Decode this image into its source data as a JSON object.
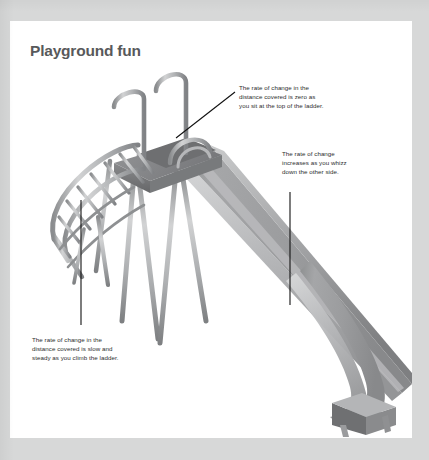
{
  "page": {
    "title": "Playground fun",
    "background_color": "#d7d8d8",
    "sheet_color": "#ffffff",
    "title_color": "#58595b"
  },
  "illustration": {
    "name": "playground-slide-illustration",
    "subject": "playground slide with ladder and platform",
    "palette": {
      "metal_light": "#c8c9ca",
      "metal_mid": "#a7a9ac",
      "metal_dark": "#808285",
      "metal_shadow": "#6d6e71",
      "slide_face": "#9d9e9f",
      "slide_light": "#c4c5c6",
      "slide_dark": "#7b7c7e",
      "deck_dark": "#6f7072",
      "leader_line": "#1a1a1a"
    }
  },
  "callouts": [
    {
      "id": "callout-top-of-ladder",
      "lines": [
        "The rate of change in the",
        "distance covered is zero as",
        "you sit at the top of the ladder."
      ]
    },
    {
      "id": "callout-whizz-down",
      "lines": [
        "The rate of change",
        "increases as you whizz",
        "down the other side."
      ]
    },
    {
      "id": "callout-climb-ladder",
      "lines": [
        "The rate of change in the",
        "distance covered is slow and",
        "steady as you climb the ladder."
      ]
    }
  ]
}
